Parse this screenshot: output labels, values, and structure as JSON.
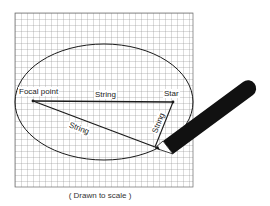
{
  "diagram": {
    "labels": {
      "focal_point": "Focal point",
      "star": "Star",
      "string_top": "String",
      "string_diagonal": "String",
      "string_short": "String"
    },
    "caption": "( Drawn to scale )",
    "colors": {
      "grid": "#888888",
      "ink": "#1a1a1a",
      "pencil": "#111111",
      "background": "#ffffff"
    },
    "grid": {
      "left": 15,
      "top": 13,
      "right": 193,
      "bottom": 187,
      "spacing": 6
    },
    "ellipse": {
      "cx": 104,
      "cy": 102,
      "rx": 89,
      "ry": 58
    },
    "points": {
      "focal_point": [
        33,
        101
      ],
      "star": [
        173,
        102
      ],
      "pencil_tip": [
        155,
        147
      ]
    }
  }
}
